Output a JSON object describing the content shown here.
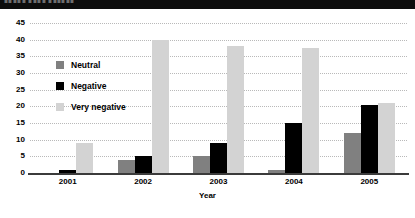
{
  "banner": {
    "text": "▮▮▮▮▮ ▮▮▮▮ ▮▮▮▮▮▮"
  },
  "chart_data": {
    "type": "bar",
    "title": "",
    "xlabel": "Year",
    "ylabel": "",
    "categories": [
      "2001",
      "2002",
      "2003",
      "2004",
      "2005"
    ],
    "series": [
      {
        "name": "Neutral",
        "color": "#808080",
        "values": [
          0,
          4,
          5,
          1,
          12
        ]
      },
      {
        "name": "Negative",
        "color": "#000000",
        "values": [
          1,
          5,
          9,
          15,
          20.5
        ]
      },
      {
        "name": "Very negative",
        "color": "#d3d3d3",
        "values": [
          9,
          40,
          38,
          37.5,
          21
        ]
      }
    ],
    "ylim": [
      0,
      45
    ],
    "ytick_step": 5,
    "yticks": [
      "0",
      "5",
      "10",
      "15",
      "20",
      "25",
      "30",
      "35",
      "40",
      "45"
    ],
    "grid": true,
    "grid_style": "dotted-horizontal",
    "legend_position": "inside-upper-left"
  }
}
